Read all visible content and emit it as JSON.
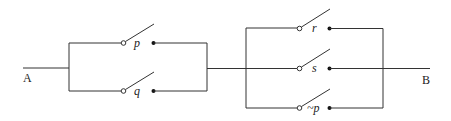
{
  "diagram": {
    "type": "switching-circuit",
    "colors": {
      "wire": "#333333",
      "background": "#ffffff"
    },
    "terminals": {
      "start": "A",
      "end": "B"
    },
    "blocks": [
      {
        "name": "parallel-block-1",
        "connection": "parallel",
        "switches": [
          {
            "label": "p"
          },
          {
            "label": "q"
          }
        ]
      },
      {
        "name": "parallel-block-2",
        "connection": "parallel",
        "switches": [
          {
            "label": "r"
          },
          {
            "label": "s"
          },
          {
            "label": "~p"
          }
        ]
      }
    ],
    "series": "block1 in series with block2"
  }
}
